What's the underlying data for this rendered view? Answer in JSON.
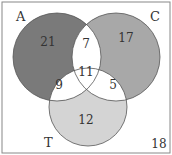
{
  "diagram": {
    "type": "venn",
    "sets": [
      {
        "label": "A",
        "color": "#7a7a7a"
      },
      {
        "label": "C",
        "color": "#a8a8a8"
      },
      {
        "label": "T",
        "color": "#d4d4d4"
      }
    ],
    "regions": {
      "A_only": "21",
      "C_only": "17",
      "T_only": "12",
      "A_C": "7",
      "A_T": "9",
      "C_T": "5",
      "A_C_T": "11",
      "outside": "18"
    }
  }
}
